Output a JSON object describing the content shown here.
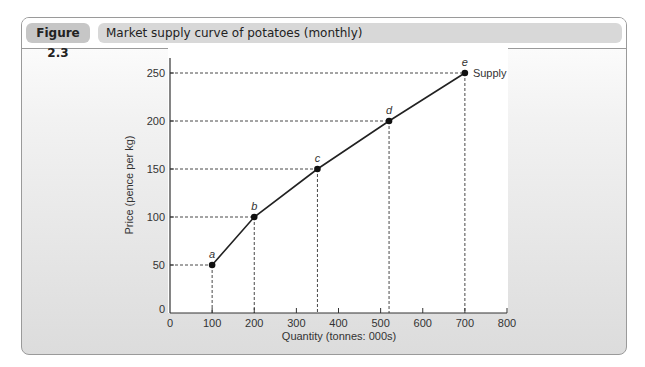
{
  "figure": {
    "label": "Figure 2.3",
    "title": "Market supply curve of potatoes (monthly)"
  },
  "chart_data": {
    "type": "line",
    "title": "Market supply curve of potatoes (monthly)",
    "xlabel": "Quantity (tonnes: 000s)",
    "ylabel": "Price (pence per kg)",
    "xlim": [
      0,
      800
    ],
    "ylim": [
      0,
      250
    ],
    "x_ticks": [
      0,
      100,
      200,
      300,
      400,
      500,
      600,
      700,
      800
    ],
    "y_ticks": [
      0,
      50,
      100,
      150,
      200,
      250
    ],
    "grid": false,
    "legend": null,
    "series": [
      {
        "name": "Supply",
        "points": [
          {
            "label": "a",
            "x": 100,
            "y": 50
          },
          {
            "label": "b",
            "x": 200,
            "y": 100
          },
          {
            "label": "c",
            "x": 350,
            "y": 150
          },
          {
            "label": "d",
            "x": 520,
            "y": 200
          },
          {
            "label": "e",
            "x": 700,
            "y": 250
          }
        ]
      }
    ],
    "annotations": [
      "Supply",
      "a",
      "b",
      "c",
      "d",
      "e"
    ],
    "dashed_guides": true
  },
  "colors": {
    "curve": "#222222",
    "guide": "#333333",
    "header_label_bg": "#c6c6c6",
    "header_title_bg": "#d8d8d8"
  }
}
